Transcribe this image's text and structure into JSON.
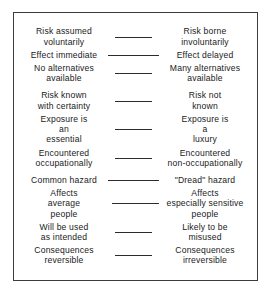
{
  "figure": {
    "frame": {
      "border_color": "#3c3c3c",
      "background": "#ffffff"
    },
    "connector_color": "#2b2b2b",
    "text_color": "#1a1a1a"
  },
  "rows": [
    {
      "id": "voluntariness",
      "left": "Risk assumed\nvoluntarily",
      "right": "Risk borne\ninvoluntarily",
      "connector": "narrow"
    },
    {
      "id": "timing",
      "left": "Effect immediate",
      "right": "Effect delayed",
      "connector": "wide"
    },
    {
      "id": "alternatives",
      "left": "No alternatives\navailable",
      "right": "Many alternatives\navailable",
      "connector": "narrow"
    },
    {
      "id": "certainty",
      "left": "Risk known\nwith certainty",
      "right": "Risk not\nknown",
      "connector": "narrow"
    },
    {
      "id": "necessity",
      "left": "Exposure is\nan\nessential",
      "right": "Exposure is\na\nluxury",
      "connector": "narrow"
    },
    {
      "id": "occupational",
      "left": "Encountered\noccupationally",
      "right": "Encountered\nnon-occupationally",
      "connector": "narrow"
    },
    {
      "id": "dread",
      "left": "Common hazard",
      "right": "\"Dread\" hazard",
      "connector": "wide"
    },
    {
      "id": "sensitivity",
      "left": "Affects\naverage\npeople",
      "right": "Affects\nespecially sensitive\npeople",
      "connector": "midleft"
    },
    {
      "id": "misuse",
      "left": "Will be used\nas intended",
      "right": "Likely to be\nmisused",
      "connector": "narrow"
    },
    {
      "id": "reversibility",
      "left": "Consequences\nreversible",
      "right": "Consequences\nirreversible",
      "connector": "narrow"
    }
  ]
}
